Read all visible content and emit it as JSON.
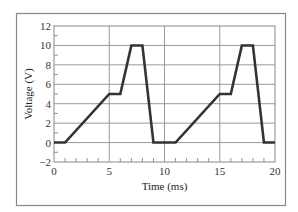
{
  "chart_data": {
    "type": "line",
    "title": "",
    "xlabel": "Time (ms)",
    "ylabel": "Voltage (V)",
    "xlim": [
      0,
      20
    ],
    "ylim": [
      -2,
      12
    ],
    "xticks": [
      0,
      5,
      10,
      15,
      20
    ],
    "xtick_labels": [
      "0",
      "5",
      "10",
      "15",
      "20"
    ],
    "xminor_step": 1,
    "yticks": [
      -2,
      0,
      2,
      4,
      6,
      8,
      10,
      12
    ],
    "ytick_labels": [
      "−2",
      "0",
      "2",
      "4",
      "6",
      "8",
      "10",
      "12"
    ],
    "yminor_step": 1,
    "grid": true,
    "legend": "none",
    "series": [
      {
        "name": "voltage",
        "color": "#333333",
        "x": [
          0,
          1,
          5,
          6,
          7,
          8,
          9,
          10,
          11,
          15,
          16,
          17,
          18,
          19,
          20
        ],
        "y": [
          0,
          0,
          5,
          5,
          10,
          10,
          0,
          0,
          0,
          5,
          5,
          10,
          10,
          0,
          0
        ]
      }
    ]
  },
  "colors": {
    "frame": "#888888",
    "grid": "#999999",
    "line": "#333333"
  }
}
